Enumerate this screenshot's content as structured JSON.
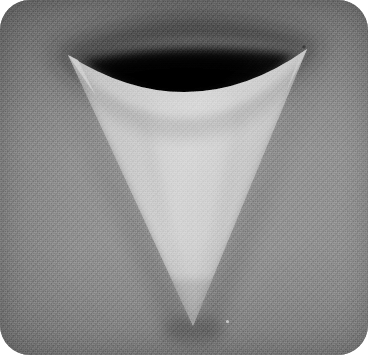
{
  "image": {
    "kind": "photograph",
    "subject": "folded-paper-cone",
    "description": "Grayscale photograph of a sheet of paper curled into a downward-pointing cone, forming an inverted triangle with a concave curved top edge and a dark crescent shadow in the hollow of the curl.",
    "orientation": "portrait",
    "width_px": 368,
    "height_px": 355,
    "corner_radius_px": 30,
    "color_mode": "grayscale"
  },
  "palette": {
    "outside_page": "#ffffff",
    "backdrop_light": "#969696",
    "backdrop_mid": "#8d8d8d",
    "backdrop_dark": "#7a7a7a",
    "paper_highlight": "#d4d4d4",
    "paper_light": "#c9c9c9",
    "paper_mid": "#bdbdbd",
    "paper_shade": "#a8a8a8",
    "cavity_shadow_core": "#0d0d0d",
    "cavity_shadow_edge": "#4a4a4a",
    "cast_shadow": "#6e6e6e",
    "speck": "#d9d9d9"
  },
  "geometry": {
    "left_cusp": {
      "x": 68,
      "y": 55
    },
    "right_cusp": {
      "x": 307,
      "y": 49
    },
    "bottom_apex": {
      "x": 193,
      "y": 326
    },
    "top_curve_control": {
      "x": 190,
      "y": 132
    },
    "crescent_top_control": {
      "x": 188,
      "y": 24
    },
    "plate_bounds": {
      "x": 0,
      "y": 0,
      "w": 368,
      "h": 355
    }
  },
  "elements": {
    "photo_plate_label": "Photograph plate",
    "backdrop_label": "Gray cloth backdrop",
    "cone_label": "Folded paper cone",
    "cavity_shadow_label": "Dark crescent cavity shadow",
    "cast_shadow_label": "Soft cast shadow",
    "speck_label": "Dust speck highlight",
    "grain_label": "Film grain texture"
  },
  "chart_data": null
}
